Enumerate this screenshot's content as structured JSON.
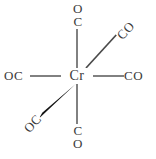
{
  "figure": {
    "kind": "chemical-structure-diagram",
    "compound": "Cr(CO)6",
    "center_atom": "Cr",
    "colors": {
      "background": "#ffffff",
      "bond": "#6b6b6b",
      "wedge_bond": "#1a1a1a",
      "text": "#3a3a3a"
    },
    "ligands": {
      "top": {
        "line1": "O",
        "line2": "C"
      },
      "bottom": {
        "line1": "C",
        "line2": "O"
      },
      "left": "OC",
      "right": "CO",
      "upper_right": "CO",
      "lower_left": "OC"
    },
    "bonds": [
      {
        "name": "bond-top",
        "style": "plain",
        "x1": 77,
        "y1": 76,
        "x2": 77,
        "y2": 23
      },
      {
        "name": "bond-bottom",
        "style": "plain",
        "x1": 77,
        "y1": 76,
        "x2": 77,
        "y2": 133
      },
      {
        "name": "bond-left",
        "style": "plain",
        "x1": 77,
        "y1": 76,
        "x2": 31,
        "y2": 76
      },
      {
        "name": "bond-right",
        "style": "plain",
        "x1": 77,
        "y1": 76,
        "x2": 124,
        "y2": 76
      },
      {
        "name": "bond-upper-right",
        "style": "plain",
        "x1": 77,
        "y1": 76,
        "x2": 117,
        "y2": 34
      },
      {
        "name": "bond-lower-left",
        "style": "wedge",
        "x1": 77,
        "y1": 76,
        "x2": 40,
        "y2": 117
      }
    ]
  }
}
